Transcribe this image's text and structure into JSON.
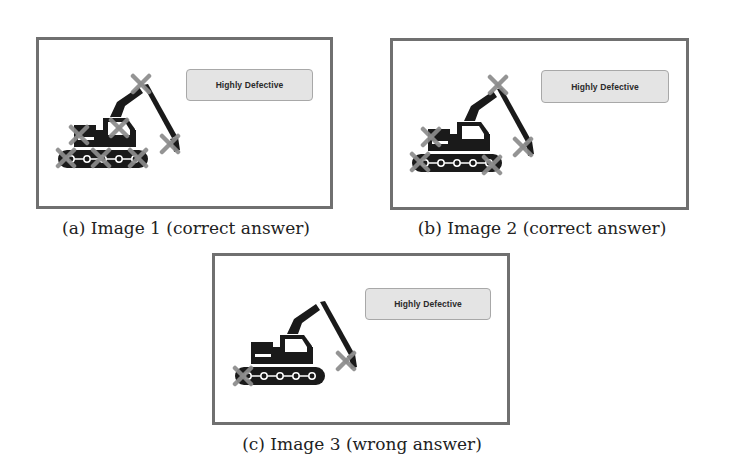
{
  "figure": {
    "panels": [
      {
        "id": "a",
        "badge_label": "Highly Defective",
        "caption": "(a) Image 1 (correct answer)",
        "x_marks": [
          "boom-top",
          "body-rear",
          "cab",
          "bucket",
          "track-left",
          "track-middle",
          "track-right"
        ]
      },
      {
        "id": "b",
        "badge_label": "Highly Defective",
        "caption": "(b) Image 2 (correct answer)",
        "x_marks": [
          "boom-top",
          "body-rear",
          "bucket",
          "track-left",
          "track-right"
        ]
      },
      {
        "id": "c",
        "badge_label": "Highly Defective",
        "caption": "(c) Image 3 (wrong answer)",
        "x_marks": [
          "track-left",
          "bucket"
        ]
      }
    ],
    "colors": {
      "frame": "#707070",
      "excavator": "#1a1a1a",
      "x_mark": "#8c8c8c",
      "badge_bg": "#e4e4e4",
      "badge_border": "#a8a8a8"
    }
  }
}
